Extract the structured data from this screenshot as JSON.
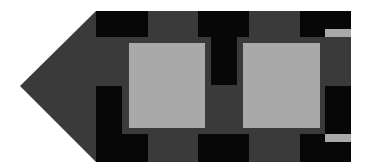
{
  "figure": {
    "colors": {
      "background": "#ffffff",
      "body": "#3a3a3a",
      "dark": "#070707",
      "light": "#a9a9a9"
    }
  }
}
